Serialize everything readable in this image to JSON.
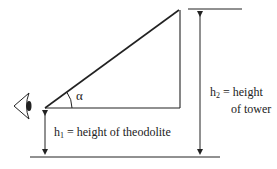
{
  "diagram": {
    "type": "angle-of-elevation",
    "colors": {
      "stroke": "#222222",
      "background": "#ffffff"
    },
    "angle_label": "α",
    "h1": {
      "symbol": "h",
      "subscript": "1",
      "text": " = height of theodolite"
    },
    "h2": {
      "symbol": "h",
      "subscript": "2",
      "text_line1": " = height",
      "text_line2": "of tower"
    },
    "observer_icon": "eye-icon"
  }
}
